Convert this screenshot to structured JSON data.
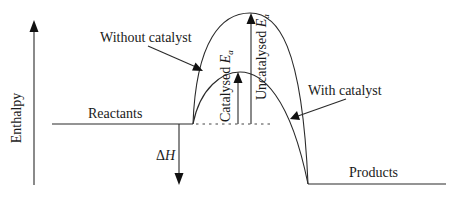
{
  "diagram": {
    "type": "energy-profile",
    "y_axis": {
      "label": "Enthalpy"
    },
    "levels": {
      "reactants": "Reactants",
      "products": "Products"
    },
    "curves": {
      "uncatalysed": "Without catalyst",
      "catalysed": "With catalyst"
    },
    "arrows": {
      "catalysed_ea_prefix": "Catalysed ",
      "uncatalysed_ea_prefix": "Uncatalysed ",
      "ea_symbol": "E",
      "ea_subscript": "a",
      "delta_h_symbol": "Δ",
      "delta_h_var": "H"
    },
    "colors": {
      "line": "#2a2a2a",
      "background": "#ffffff"
    }
  }
}
